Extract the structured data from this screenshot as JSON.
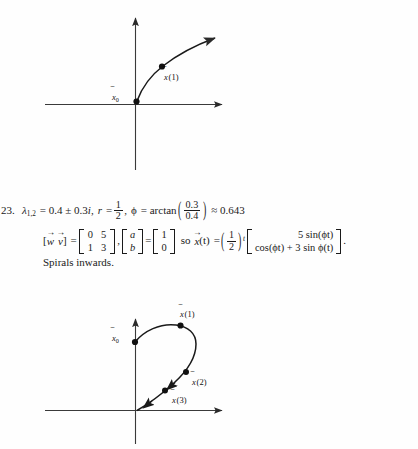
{
  "document": {
    "item_number": "23.",
    "figures": {
      "top": {
        "name": "phase-portrait-spiral-outward",
        "labels": {
          "x0": "x",
          "x0_sub": "0",
          "x1": "x",
          "x1_arg": "(1)"
        }
      },
      "bottom": {
        "name": "phase-portrait-spiral-inward",
        "labels": {
          "x0": "x",
          "x0_sub": "0",
          "x1": "x",
          "x1_arg": "(1)",
          "x2": "x",
          "x2_arg": "(2)",
          "x3": "x",
          "x3_arg": "(3)"
        }
      }
    },
    "line1": {
      "lambda": "λ",
      "lambda_sub": "1,2",
      "eq1": "= 0.4 ± 0.3",
      "i": "i",
      "comma1": ",",
      "r": "r",
      "eq2": "=",
      "half_num": "1",
      "half_den": "2",
      "comma2": ",",
      "phi": "ϕ",
      "eq3": "= arctan",
      "paren_open": "(",
      "arg_num": "0.3",
      "arg_den": "0.4",
      "paren_close": ")",
      "approx": "≈ 0.643"
    },
    "line2": {
      "bracket_open": "[",
      "w": "w",
      "v": "v",
      "bracket_close": "]",
      "eq1": "=",
      "matrix_wv": [
        [
          "0",
          "5"
        ],
        [
          "1",
          "3"
        ]
      ],
      "comma": ",",
      "vec_ab": [
        "a",
        "b"
      ],
      "eq2": "=",
      "vec_10": [
        "1",
        "0"
      ],
      "so": "so",
      "x": "x",
      "of_t": "(t)",
      "eq3": "=",
      "paren_open": "(",
      "half_num": "1",
      "half_den": "2",
      "paren_close": ")",
      "exponent": "t",
      "matrix_sol": [
        "5 sin(ϕt)",
        "cos(ϕt) + 3 sin ϕ(t)"
      ],
      "period": "."
    },
    "line3": {
      "text": "Spirals inwards."
    }
  },
  "colors": {
    "ink": "#1a1a1a",
    "axis": "#3a3a3a",
    "page": "#fefefe"
  }
}
